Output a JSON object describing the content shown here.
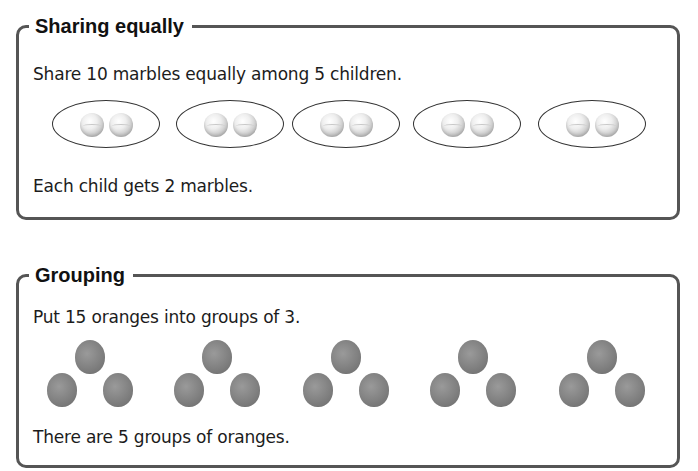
{
  "sharing": {
    "title": "Sharing equally",
    "prompt": "Share 10 marbles equally among 5 children.",
    "result": "Each child gets 2 marbles.",
    "groups": 5,
    "items_per_group": 2,
    "item_icon": "marble-icon"
  },
  "grouping": {
    "title": "Grouping",
    "prompt": "Put 15 oranges into groups of 3.",
    "result": "There are 5 groups of oranges.",
    "groups": 5,
    "items_per_group": 3,
    "item_icon": "orange-icon"
  },
  "colors": {
    "border": "#555555",
    "text": "#1c1c1c",
    "marble": "#d0d0d0",
    "orange": "#808080"
  }
}
